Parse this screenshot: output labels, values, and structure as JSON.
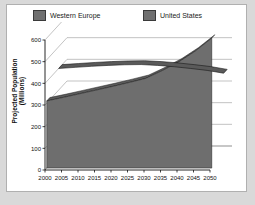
{
  "legend": {
    "position": "top",
    "items": [
      {
        "label": "Western Europe",
        "color": "#707070"
      },
      {
        "label": "United States",
        "color": "#707070"
      }
    ]
  },
  "axes": {
    "xlabel": "Year",
    "ylabel": "Projected Population (Millions)",
    "yticks": [
      "0",
      "100",
      "200",
      "300",
      "400",
      "500",
      "600"
    ],
    "xticks": [
      "2000",
      "2005",
      "2010",
      "2015",
      "2020",
      "2025",
      "2030",
      "2035",
      "2040",
      "2045",
      "2050"
    ]
  },
  "chart_data": {
    "type": "area",
    "title": "",
    "subtitle": "",
    "xlabel": "Year",
    "ylabel": "Projected Population (Millions)",
    "x": [
      2000,
      2005,
      2010,
      2015,
      2020,
      2025,
      2030,
      2035,
      2040,
      2045,
      2050
    ],
    "ylim": [
      0,
      600
    ],
    "xlim": [
      2000,
      2050
    ],
    "grid": true,
    "legend_position": "top",
    "three_d": true,
    "series": [
      {
        "name": "Western Europe",
        "color": "#707070",
        "values": [
          400,
          405,
          410,
          414,
          417,
          418,
          414,
          408,
          400,
          391,
          378
        ]
      },
      {
        "name": "United States",
        "color": "#707070",
        "values": [
          310,
          326,
          343,
          360,
          377,
          395,
          414,
          450,
          490,
          540,
          600
        ]
      }
    ],
    "annotations": []
  },
  "colors": {
    "plot_background": "#ffffff",
    "page_background": "#d9d9d9",
    "frame_border": "#b0b0b0",
    "gridline": "#9a9a9a",
    "axis": "#111111",
    "series_fill": "#6e6e6e",
    "series_fill_dark": "#5a5a5a",
    "series_line": "#1a1a1a"
  }
}
